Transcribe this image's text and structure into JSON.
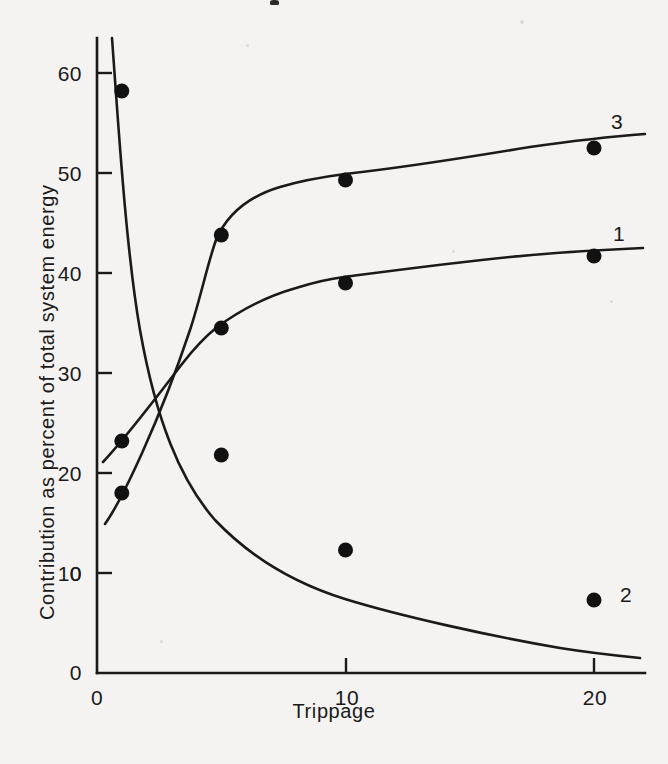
{
  "chart_data": {
    "type": "line",
    "title": "",
    "xlabel": "Trippage",
    "ylabel": "Contribution as percent of total system energy",
    "xlim": [
      0,
      22
    ],
    "ylim": [
      0,
      63
    ],
    "xticks": [
      0,
      10,
      20
    ],
    "xticklabels": [
      "0",
      "10",
      "20"
    ],
    "yticks": [
      0,
      10,
      20,
      30,
      40,
      50,
      60
    ],
    "yticklabels": [
      "0",
      "10",
      "20",
      "30",
      "40",
      "50",
      "60"
    ],
    "grid": false,
    "legend_position": "right-of-curve-end",
    "origin_label": "0",
    "series": [
      {
        "name": "1",
        "label": "1",
        "marker": "filled-circle",
        "x": [
          1,
          5,
          10,
          20
        ],
        "values": [
          23.2,
          34.5,
          39.0,
          41.7
        ]
      },
      {
        "name": "2",
        "label": "2",
        "marker": "filled-circle",
        "x": [
          1,
          5,
          10,
          20
        ],
        "values": [
          58.2,
          21.8,
          12.3,
          7.3
        ]
      },
      {
        "name": "3",
        "label": "3",
        "marker": "filled-circle",
        "x": [
          1,
          5,
          10,
          20
        ],
        "values": [
          18.0,
          43.8,
          49.3,
          52.5
        ]
      }
    ]
  },
  "axes": {
    "x_title": "Trippage",
    "y_title": "Contribution as percent of total system energy",
    "x_tick_labels": [
      "0",
      "10",
      "20"
    ],
    "y_tick_labels": [
      "0",
      "10",
      "20",
      "30",
      "40",
      "50",
      "60"
    ]
  },
  "series_labels": {
    "s1": "1",
    "s2": "2",
    "s3": "3"
  },
  "colors": {
    "ink": "#1a1a1a",
    "paper": "#f4f3f1"
  }
}
